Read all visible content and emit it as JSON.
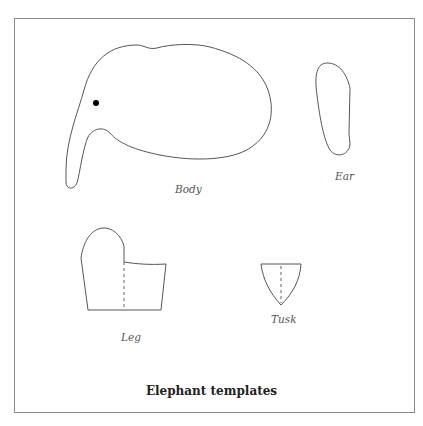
{
  "figure": {
    "caption": "Elephant templates",
    "pieces": [
      {
        "id": "body",
        "label": "Body"
      },
      {
        "id": "ear",
        "label": "Ear"
      },
      {
        "id": "leg",
        "label": "Leg"
      },
      {
        "id": "tusk",
        "label": "Tusk"
      }
    ]
  }
}
